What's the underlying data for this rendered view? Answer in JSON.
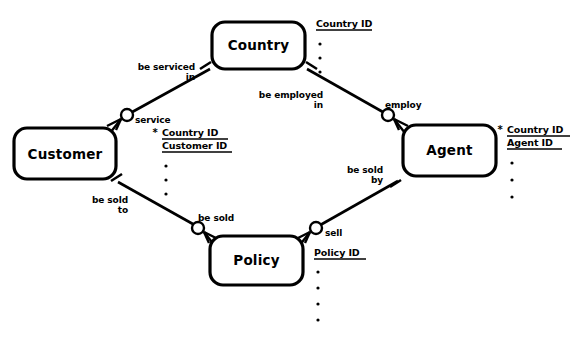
{
  "diagram": {
    "notation": "barker-crows-foot",
    "background_color": "#ffffff",
    "line_color": "#000000",
    "entities": [
      {
        "id": "customer",
        "name": "Customer",
        "box": {
          "x": 14,
          "y": 128,
          "w": 102,
          "h": 51
        },
        "attributes": {
          "items": [
            {
              "text": "* Country ID",
              "underline": true,
              "mandatory_marker": "*"
            },
            {
              "text": "Customer ID",
              "underline": true,
              "mandatory_marker": ""
            }
          ],
          "ellipsis_dots": 3
        }
      },
      {
        "id": "country",
        "name": "Country",
        "box": {
          "x": 212,
          "y": 22,
          "w": 93,
          "h": 47
        },
        "attributes": {
          "items": [
            {
              "text": "Country ID",
              "underline": true,
              "mandatory_marker": ""
            }
          ],
          "ellipsis_dots": 3
        }
      },
      {
        "id": "agent",
        "name": "Agent",
        "box": {
          "x": 403,
          "y": 125,
          "w": 93,
          "h": 51
        },
        "attributes": {
          "items": [
            {
              "text": "* Country ID",
              "underline": true,
              "mandatory_marker": "*"
            },
            {
              "text": "Agent ID",
              "underline": true,
              "mandatory_marker": ""
            }
          ],
          "ellipsis_dots": 3
        }
      },
      {
        "id": "policy",
        "name": "Policy",
        "box": {
          "x": 210,
          "y": 236,
          "w": 93,
          "h": 49
        },
        "attributes": {
          "items": [
            {
              "text": "Policy ID",
              "underline": true,
              "mandatory_marker": ""
            }
          ],
          "ellipsis_dots": 4
        }
      }
    ],
    "relationships": [
      {
        "id": "customer-country",
        "from_entity": "customer",
        "to_entity": "country",
        "from_label": "service",
        "to_label": "be serviced\nin",
        "to_label_lines": [
          "be serviced",
          "in"
        ],
        "from_cardinality": "many-optional",
        "to_cardinality": "one-mandatory"
      },
      {
        "id": "country-agent",
        "from_entity": "country",
        "to_entity": "agent",
        "from_label": "be employed\nin",
        "from_label_lines": [
          "be employed",
          "in"
        ],
        "to_label": "employ",
        "from_cardinality": "one-mandatory",
        "to_cardinality": "many-optional"
      },
      {
        "id": "customer-policy",
        "from_entity": "customer",
        "to_entity": "policy",
        "from_label": "be sold\nto",
        "from_label_lines": [
          "be sold",
          "to"
        ],
        "to_label": "be sold",
        "from_cardinality": "one-mandatory",
        "to_cardinality": "many-optional"
      },
      {
        "id": "policy-agent",
        "from_entity": "policy",
        "to_entity": "agent",
        "from_label": "sell",
        "to_label": "be sold\nby",
        "to_label_lines": [
          "be sold",
          "by"
        ],
        "from_cardinality": "many-optional",
        "to_cardinality": "one-mandatory"
      }
    ],
    "labels": {
      "service": "service",
      "be_serviced": "be serviced",
      "in_1": "in",
      "be_employed": "be employed",
      "in_2": "in",
      "employ": "employ",
      "be_sold": "be sold",
      "to": "to",
      "be_sold_2": "be sold",
      "be_sold_3": "be sold",
      "by": "by",
      "sell": "sell"
    },
    "attribute_labels": {
      "customer_attr_1": "Country ID",
      "customer_attr_2": "Customer ID",
      "country_attr_1": "Country ID",
      "agent_attr_1": "Country ID",
      "agent_attr_2": "Agent ID",
      "policy_attr_1": "Policy ID",
      "star": "*"
    },
    "entity_names": {
      "customer": "Customer",
      "country": "Country",
      "agent": "Agent",
      "policy": "Policy"
    }
  }
}
